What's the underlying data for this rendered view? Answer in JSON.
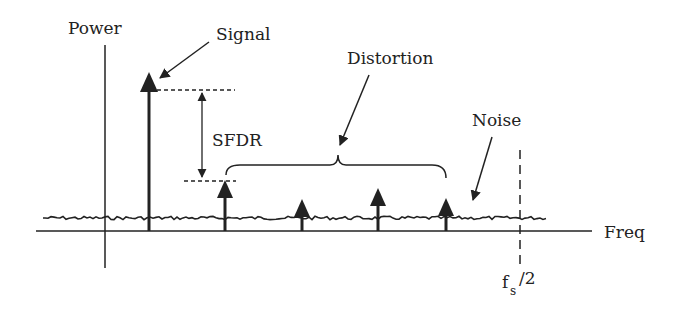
{
  "labels": {
    "power": "Power",
    "signal": "Signal",
    "sfdr": "SFDR",
    "distortion": "Distortion",
    "noise": "Noise",
    "freq": "Freq",
    "fs_base": "f",
    "fs_sub": "s",
    "fs_suffix": "/2"
  },
  "spectrum": {
    "signal_tone": {
      "label": "Signal",
      "relative_power": 1.0
    },
    "distortion_tones": [
      {
        "label": "Distortion 1",
        "relative_power": 0.45
      },
      {
        "label": "Distortion 2",
        "relative_power": 0.28
      },
      {
        "label": "Distortion 3",
        "relative_power": 0.35
      },
      {
        "label": "Distortion 4",
        "relative_power": 0.28
      }
    ],
    "noise_floor": "Noise",
    "nyquist_marker": "fs/2"
  },
  "colors": {
    "ink": "#222222",
    "background": "#ffffff"
  }
}
